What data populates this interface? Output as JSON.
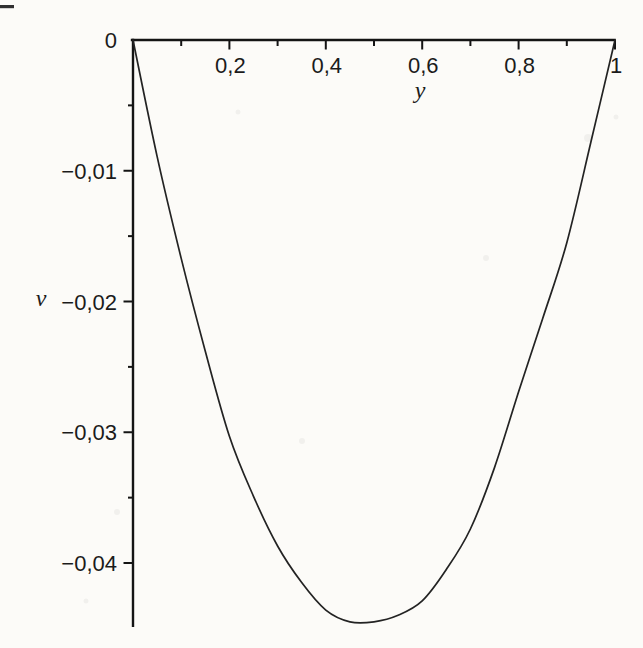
{
  "page": {
    "background": "#fcfbf8"
  },
  "figure": {
    "axis_color": "#141414",
    "curve_color": "#232323",
    "text_color": "#1b1b1b",
    "decimal_separator": ","
  },
  "chart_data": {
    "type": "line",
    "title": "",
    "xlabel": "y",
    "ylabel": "v",
    "xlim": [
      0,
      1
    ],
    "ylim": [
      -0.0455,
      0
    ],
    "grid": false,
    "legend": "none",
    "x_axis_position": "top",
    "y_axis_position": "left",
    "x_axis": {
      "major_ticks": [
        {
          "value": 0.2,
          "label": "0,2"
        },
        {
          "value": 0.4,
          "label": "0,4"
        },
        {
          "value": 0.6,
          "label": "0,6"
        },
        {
          "value": 0.8,
          "label": "0,8"
        },
        {
          "value": 1.0,
          "label": "1"
        }
      ],
      "minor_ticks": [
        0.1,
        0.3,
        0.5,
        0.7,
        0.9
      ]
    },
    "y_axis": {
      "major_ticks": [
        {
          "value": 0,
          "label": "0"
        },
        {
          "value": -0.01,
          "label": "−0,01"
        },
        {
          "value": -0.02,
          "label": "−0,02"
        },
        {
          "value": -0.03,
          "label": "−0,03"
        },
        {
          "value": -0.04,
          "label": "−0,04"
        }
      ],
      "minor_ticks": [
        -0.005,
        -0.015,
        -0.025,
        -0.035
      ]
    },
    "series": [
      {
        "name": "v(y)",
        "minimum": {
          "y": 0.46,
          "v": -0.0446
        },
        "points": [
          [
            0.0,
            0.0
          ],
          [
            0.05,
            -0.0089
          ],
          [
            0.1,
            -0.0167
          ],
          [
            0.15,
            -0.0238
          ],
          [
            0.2,
            -0.0303
          ],
          [
            0.25,
            -0.0349
          ],
          [
            0.3,
            -0.0387
          ],
          [
            0.35,
            -0.0415
          ],
          [
            0.4,
            -0.0436
          ],
          [
            0.45,
            -0.0445
          ],
          [
            0.5,
            -0.0445
          ],
          [
            0.55,
            -0.044
          ],
          [
            0.6,
            -0.0429
          ],
          [
            0.65,
            -0.0405
          ],
          [
            0.7,
            -0.0374
          ],
          [
            0.75,
            -0.0327
          ],
          [
            0.8,
            -0.0269
          ],
          [
            0.85,
            -0.0213
          ],
          [
            0.9,
            -0.0155
          ],
          [
            0.95,
            -0.0078
          ],
          [
            1.0,
            0.0
          ]
        ]
      }
    ]
  }
}
